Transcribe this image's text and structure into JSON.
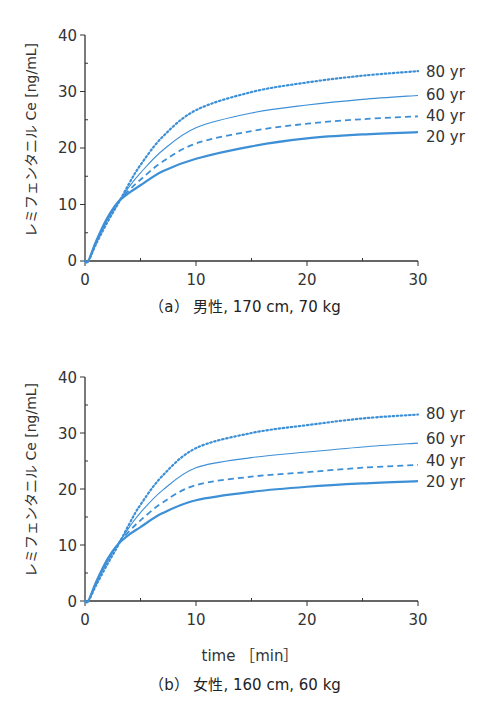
{
  "chart_data": [
    {
      "type": "line",
      "panel": "a",
      "caption": "（a） 男性, 170 cm, 70 kg",
      "xlabel": "",
      "ylabel": "レミフェンタニル Ce [ng/mL]",
      "xlim": [
        0,
        30
      ],
      "ylim": [
        0,
        40
      ],
      "xticks": [
        0,
        10,
        20,
        30
      ],
      "yticks": [
        0,
        10,
        20,
        30,
        40
      ],
      "grid": false,
      "legend_position": "inline-right",
      "x": [
        0,
        0.3,
        1,
        2,
        3,
        4,
        5,
        7,
        10,
        15,
        20,
        25,
        30
      ],
      "series": [
        {
          "name": "80 yr",
          "style": "dotted",
          "values": [
            0,
            0,
            3.0,
            6.8,
            10.2,
            13.8,
            17.0,
            22.0,
            26.7,
            29.9,
            31.6,
            32.8,
            33.6
          ]
        },
        {
          "name": "60 yr",
          "style": "thin-solid",
          "values": [
            0,
            0,
            3.2,
            7.2,
            10.4,
            13.2,
            15.6,
            19.6,
            23.6,
            26.2,
            27.6,
            28.6,
            29.3
          ]
        },
        {
          "name": "40 yr",
          "style": "dashed",
          "values": [
            0,
            0,
            3.3,
            7.4,
            10.5,
            12.6,
            14.4,
            17.6,
            20.8,
            23.0,
            24.3,
            25.1,
            25.6
          ]
        },
        {
          "name": "20 yr",
          "style": "thick-solid",
          "values": [
            0,
            0,
            3.5,
            7.6,
            10.5,
            12.1,
            13.4,
            15.9,
            18.1,
            20.3,
            21.7,
            22.4,
            22.8
          ]
        }
      ]
    },
    {
      "type": "line",
      "panel": "b",
      "caption": "（b） 女性, 160 cm, 60 kg",
      "xlabel": "time ［min］",
      "ylabel": "レミフェンタニル Ce [ng/mL]",
      "xlim": [
        0,
        30
      ],
      "ylim": [
        0,
        40
      ],
      "xticks": [
        0,
        10,
        20,
        30
      ],
      "yticks": [
        0,
        10,
        20,
        30,
        40
      ],
      "grid": false,
      "legend_position": "inline-right",
      "x": [
        0,
        0.3,
        1,
        2,
        3,
        4,
        5,
        7,
        10,
        15,
        20,
        25,
        30
      ],
      "series": [
        {
          "name": "80 yr",
          "style": "dotted",
          "values": [
            0,
            0,
            2.8,
            6.5,
            10.0,
            13.8,
            17.2,
            22.4,
            27.3,
            30.0,
            31.4,
            32.6,
            33.3
          ]
        },
        {
          "name": "60 yr",
          "style": "thin-solid",
          "values": [
            0,
            0,
            3.0,
            7.0,
            10.3,
            13.2,
            15.8,
            19.8,
            23.8,
            25.6,
            26.6,
            27.5,
            28.2
          ]
        },
        {
          "name": "40 yr",
          "style": "dashed",
          "values": [
            0,
            0,
            3.2,
            7.2,
            10.3,
            12.5,
            14.4,
            17.6,
            20.7,
            22.2,
            23.0,
            23.8,
            24.3
          ]
        },
        {
          "name": "20 yr",
          "style": "thick-solid",
          "values": [
            0,
            0,
            3.4,
            7.4,
            10.2,
            11.9,
            13.2,
            15.7,
            18.0,
            19.5,
            20.4,
            21.0,
            21.4
          ]
        }
      ]
    }
  ],
  "colors": {
    "line": "#3d8fd6",
    "axis": "#333333",
    "text": "#333333"
  },
  "panels": [
    {
      "ylabel": "レミフェンタニル Ce [ng/mL]",
      "xticks": [
        "0",
        "10",
        "20",
        "30"
      ],
      "yticks": [
        "0",
        "10",
        "20",
        "30",
        "40"
      ],
      "labels": [
        "80 yr",
        "60 yr",
        "40 yr",
        "20 yr"
      ],
      "caption": "（a） 男性, 170 cm, 70 kg"
    },
    {
      "ylabel": "レミフェンタニル Ce [ng/mL]",
      "xticks": [
        "0",
        "10",
        "20",
        "30"
      ],
      "yticks": [
        "0",
        "10",
        "20",
        "30",
        "40"
      ],
      "labels": [
        "80 yr",
        "60 yr",
        "40 yr",
        "20 yr"
      ],
      "xlabel": "time ［min］",
      "caption": "（b） 女性, 160 cm, 60 kg"
    }
  ]
}
